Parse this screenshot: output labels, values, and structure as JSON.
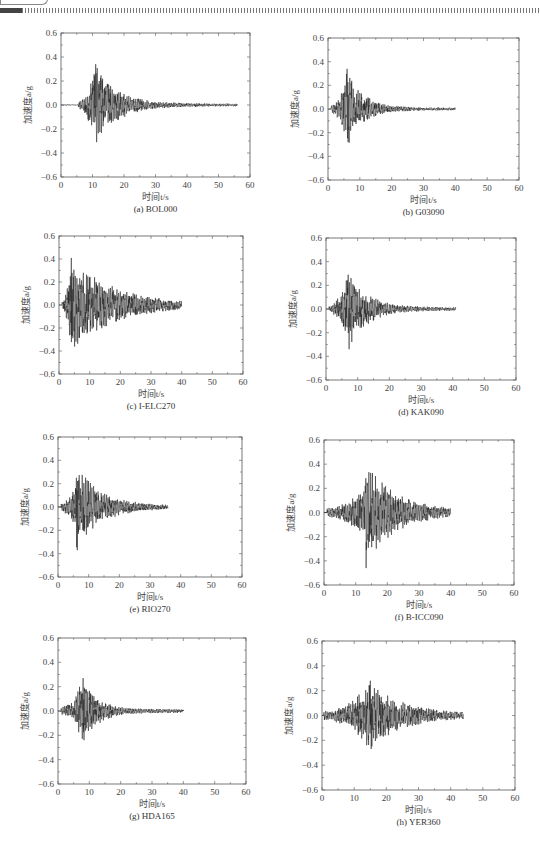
{
  "header": {
    "decoration": "dashed-rule"
  },
  "colors": {
    "axis": "#555555",
    "trace": "#222222",
    "text": "#333333"
  },
  "chart_data": [
    {
      "id": "a",
      "type": "line",
      "caption": "(a) BOL000",
      "xlabel": "时间t/s",
      "ylabel": "加速度a/g",
      "xlim": [
        0,
        60
      ],
      "ylim": [
        -0.6,
        0.6
      ],
      "xticks": [
        0,
        10,
        20,
        30,
        40,
        50,
        60
      ],
      "yticks": [
        0.6,
        0.4,
        0.2,
        0.0,
        -0.2,
        -0.4,
        -0.6
      ],
      "grid": false,
      "duration": 56,
      "onset": 5.5,
      "peak_time": 11,
      "peak_max": 0.34,
      "peak_min": -0.31,
      "decay": 7,
      "tail": 0.012,
      "seed": 3
    },
    {
      "id": "b",
      "type": "line",
      "caption": "(b) G03090",
      "xlabel": "时间t/s",
      "ylabel": "加速度a/g",
      "xlim": [
        0,
        60
      ],
      "ylim": [
        -0.6,
        0.6
      ],
      "xticks": [
        0,
        10,
        20,
        30,
        40,
        50,
        60
      ],
      "yticks": [
        0.6,
        0.4,
        0.2,
        0.0,
        -0.2,
        -0.4,
        -0.6
      ],
      "grid": false,
      "duration": 40,
      "onset": 1,
      "peak_time": 6,
      "peak_max": 0.34,
      "peak_min": -0.28,
      "decay": 5,
      "tail": 0.012,
      "seed": 7
    },
    {
      "id": "c",
      "type": "line",
      "caption": "(c) I-ELC270",
      "xlabel": "时间t/s",
      "ylabel": "加速度a/g",
      "xlim": [
        0,
        60
      ],
      "ylim": [
        -0.6,
        0.6
      ],
      "xticks": [
        0,
        10,
        20,
        30,
        40,
        50,
        60
      ],
      "yticks": [
        0.6,
        0.4,
        0.2,
        0.0,
        -0.2,
        -0.4,
        -0.6
      ],
      "grid": false,
      "duration": 40,
      "onset": 1,
      "peak_time": 4,
      "peak_max": 0.41,
      "peak_min": -0.27,
      "decay": 14,
      "tail": 0.01,
      "seed": 11
    },
    {
      "id": "d",
      "type": "line",
      "caption": "(d) KAK090",
      "xlabel": "时间t/s",
      "ylabel": "加速度a/g",
      "xlim": [
        0,
        60
      ],
      "ylim": [
        -0.6,
        0.6
      ],
      "xticks": [
        0,
        10,
        20,
        30,
        40,
        50,
        60
      ],
      "yticks": [
        0.6,
        0.4,
        0.2,
        0.0,
        -0.2,
        -0.4,
        -0.6
      ],
      "grid": false,
      "duration": 41,
      "onset": 1,
      "peak_time": 7,
      "peak_max": 0.29,
      "peak_min": -0.34,
      "decay": 6,
      "tail": 0.015,
      "seed": 19
    },
    {
      "id": "e",
      "type": "line",
      "caption": "(e) RIO270",
      "xlabel": "时间t/s",
      "ylabel": "加速度a/g",
      "xlim": [
        0,
        60
      ],
      "ylim": [
        -0.6,
        0.6
      ],
      "xticks": [
        0,
        10,
        20,
        30,
        40,
        50,
        60
      ],
      "yticks": [
        0.6,
        0.4,
        0.2,
        0.0,
        -0.2,
        -0.4,
        -0.6
      ],
      "grid": false,
      "duration": 36,
      "onset": 1,
      "peak_time": 6,
      "peak_max": 0.25,
      "peak_min": -0.37,
      "decay": 8,
      "tail": 0.012,
      "seed": 23
    },
    {
      "id": "f",
      "type": "line",
      "caption": "(f) B-ICC090",
      "xlabel": "时间t/s",
      "ylabel": "加速度a/g",
      "xlim": [
        0,
        60
      ],
      "ylim": [
        -0.6,
        0.6
      ],
      "xticks": [
        0,
        10,
        20,
        30,
        40,
        50,
        60
      ],
      "yticks": [
        0.6,
        0.4,
        0.2,
        0.0,
        -0.2,
        -0.4,
        -0.6
      ],
      "grid": false,
      "duration": 40,
      "onset": 1,
      "peak_time": 13,
      "peak_max": 0.22,
      "peak_min": -0.46,
      "decay": 9,
      "tail": 0.02,
      "seed": 29
    },
    {
      "id": "g",
      "type": "line",
      "caption": "(g) HDA165",
      "xlabel": "时间t/s",
      "ylabel": "加速度a/g",
      "xlim": [
        0,
        60
      ],
      "ylim": [
        -0.6,
        0.6
      ],
      "xticks": [
        0,
        10,
        20,
        30,
        40,
        50,
        60
      ],
      "yticks": [
        0.6,
        0.4,
        0.2,
        0.0,
        -0.2,
        -0.4,
        -0.6
      ],
      "grid": false,
      "duration": 40,
      "onset": 1,
      "peak_time": 8,
      "peak_max": 0.27,
      "peak_min": -0.24,
      "decay": 5,
      "tail": 0.015,
      "seed": 31
    },
    {
      "id": "h",
      "type": "line",
      "caption": "(h) YER360",
      "xlabel": "时间t/s",
      "ylabel": "加速度a/g",
      "xlim": [
        0,
        60
      ],
      "ylim": [
        -0.6,
        0.6
      ],
      "xticks": [
        0,
        10,
        20,
        30,
        40,
        50,
        60
      ],
      "yticks": [
        0.6,
        0.4,
        0.2,
        0.0,
        -0.2,
        -0.4,
        -0.6
      ],
      "grid": false,
      "duration": 44,
      "onset": 0.5,
      "peak_time": 15,
      "peak_max": 0.28,
      "peak_min": -0.27,
      "decay": 10,
      "tail": 0.015,
      "seed": 37
    }
  ],
  "layout": {
    "panels": [
      {
        "id": "a",
        "plot": {
          "x": 61,
          "y": 33,
          "w": 189,
          "h": 144
        }
      },
      {
        "id": "b",
        "plot": {
          "x": 328,
          "y": 38,
          "w": 191,
          "h": 142
        }
      },
      {
        "id": "c",
        "plot": {
          "x": 59,
          "y": 236,
          "w": 184,
          "h": 138
        }
      },
      {
        "id": "d",
        "plot": {
          "x": 326,
          "y": 238,
          "w": 190,
          "h": 142
        }
      },
      {
        "id": "e",
        "plot": {
          "x": 58,
          "y": 437,
          "w": 184,
          "h": 140
        }
      },
      {
        "id": "f",
        "plot": {
          "x": 324,
          "y": 440,
          "w": 190,
          "h": 145
        }
      },
      {
        "id": "g",
        "plot": {
          "x": 58,
          "y": 638,
          "w": 188,
          "h": 146
        }
      },
      {
        "id": "h",
        "plot": {
          "x": 322,
          "y": 641,
          "w": 193,
          "h": 149
        }
      }
    ]
  }
}
